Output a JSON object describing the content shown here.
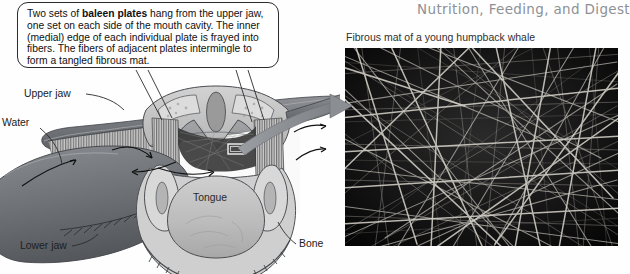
{
  "header": {
    "chapter_title": "Nutrition, Feeding, and Digest"
  },
  "callout": {
    "name": "baleen-plates-callout",
    "text_before_bold": "Two sets of ",
    "bold_term": "baleen plates",
    "text_after_bold": " hang from the upper jaw, one set on each side of the mouth cavity. The inner (medial) edge of each individual plate is frayed into fibers. The fibers of adjacent plates intermingle to form a tangled fibrous mat."
  },
  "diagram": {
    "name": "whale-head-cross-section",
    "labels": {
      "upper_jaw": "Upper jaw",
      "water": "Water",
      "lower_jaw": "Lower jaw",
      "tongue": "Tongue",
      "bone": "Bone"
    },
    "detail_marker": "detail-box-marker",
    "connector": "magnification-arrow"
  },
  "photo": {
    "name": "fibrous-mat-photo",
    "caption": "Fibrous mat of a young humpback whale"
  },
  "colors": {
    "title_gray": "#8d9196",
    "ink": "#1a1a1a",
    "photo_dark": "#0e0e0e",
    "arrow_gray": "#8e9296",
    "jaw_dark": "#6f7276",
    "tissue_light": "#c9c9c9"
  }
}
